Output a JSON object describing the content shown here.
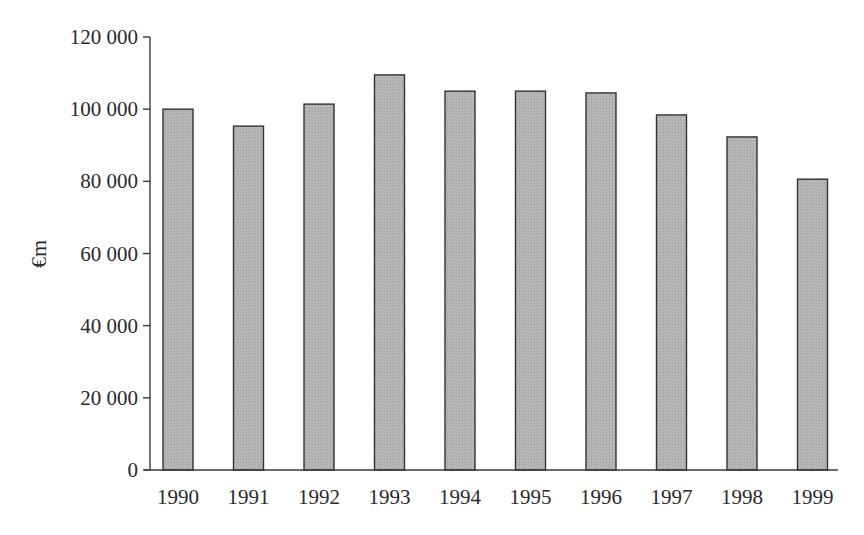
{
  "chart_data": {
    "type": "bar",
    "title": "",
    "xlabel": "",
    "ylabel": "€m",
    "categories": [
      "1990",
      "1991",
      "1992",
      "1993",
      "1994",
      "1995",
      "1996",
      "1997",
      "1998",
      "1999"
    ],
    "values": [
      100000,
      95300,
      101400,
      109500,
      105000,
      105000,
      104500,
      98400,
      92300,
      80600
    ],
    "ylim": [
      0,
      120000
    ],
    "yticks": [
      0,
      20000,
      40000,
      60000,
      80000,
      100000,
      120000
    ],
    "ytick_labels": [
      "0",
      "20 000",
      "40 000",
      "60 000",
      "80 000",
      "100 000",
      "120 000"
    ],
    "grid": false,
    "legend": "none",
    "bar_color": "#b4b4b4",
    "edge_color": "#333333"
  }
}
